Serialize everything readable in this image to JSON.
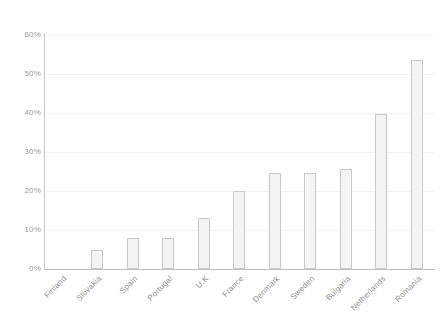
{
  "chart_data": {
    "type": "bar",
    "title": "",
    "subtitle": "",
    "xlabel": "",
    "ylabel": "",
    "ylim": [
      0,
      60
    ],
    "y_tick_labels": [
      "60%",
      "50%",
      "40%",
      "30%",
      "20%",
      "10%",
      "0%"
    ],
    "y_tick_values": [
      60,
      50,
      40,
      30,
      20,
      10,
      0
    ],
    "grid": true,
    "legend": false,
    "legend_position": "none",
    "value_suffix": "%",
    "categories": [
      "Finland",
      "Slovakia",
      "Spain",
      "Portugal",
      "U.K",
      "France",
      "Denmark",
      "Sweden",
      "Bulgaria",
      "Netherlands",
      "Romania"
    ],
    "values": [
      0,
      4.9,
      8.0,
      8.0,
      13.0,
      19.9,
      24.7,
      24.7,
      25.6,
      39.7,
      53.7
    ]
  },
  "style": {
    "bar_fill": "#f4f4f4",
    "bar_border": "#c9c9c9",
    "gridline": "#f2f2f2",
    "axis_line": "#c4c4c4",
    "tick_text": "#9b9b9b",
    "background": "#ffffff"
  }
}
